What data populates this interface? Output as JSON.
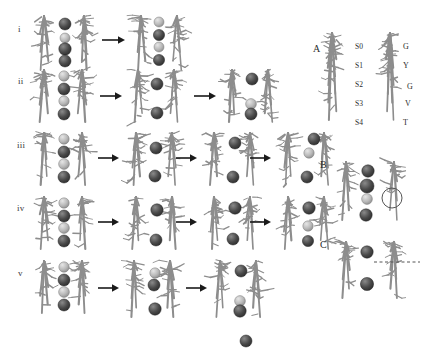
{
  "figure": {
    "title_visible": false,
    "background": "#ffffff",
    "ion_color_dark": "#4a4a4a",
    "ion_color_light": "#b9b9b9",
    "backbone_color": "#8d8d8d",
    "arrow_color": "#1a1a1a",
    "annotation_color": "#555555"
  },
  "left_panel": {
    "rows": [
      {
        "label": "i",
        "label_x": 18,
        "label_y": 24,
        "y": 14,
        "states": [
          {
            "x": 34,
            "width": 62,
            "height": 58,
            "ions": [
              {
                "cx": 31,
                "cy": 10,
                "r": 6.0,
                "shade": "dark"
              },
              {
                "cx": 31,
                "cy": 24,
                "r": 5.0,
                "shade": "light"
              },
              {
                "cx": 31,
                "cy": 35,
                "r": 6.2,
                "shade": "dark"
              },
              {
                "cx": 31,
                "cy": 47,
                "r": 6.0,
                "shade": "dark"
              }
            ]
          },
          {
            "x": 131,
            "width": 58,
            "height": 58,
            "ions": [
              {
                "cx": 28,
                "cy": 8,
                "r": 5.0,
                "shade": "light"
              },
              {
                "cx": 28,
                "cy": 21,
                "r": 5.6,
                "shade": "dark"
              },
              {
                "cx": 28,
                "cy": 33,
                "r": 5.0,
                "shade": "light"
              },
              {
                "cx": 28,
                "cy": 46,
                "r": 5.6,
                "shade": "dark"
              }
            ]
          }
        ],
        "arrows": [
          {
            "x": 102,
            "y": 40,
            "len": 22
          }
        ],
        "free_ions": []
      },
      {
        "label": "ii",
        "label_x": 18,
        "label_y": 76,
        "y": 68,
        "states": [
          {
            "x": 34,
            "width": 60,
            "height": 56,
            "ions": [
              {
                "cx": 30,
                "cy": 8,
                "r": 5.2,
                "shade": "light"
              },
              {
                "cx": 30,
                "cy": 21,
                "r": 6.0,
                "shade": "dark"
              },
              {
                "cx": 30,
                "cy": 33,
                "r": 5.2,
                "shade": "light"
              },
              {
                "cx": 30,
                "cy": 46,
                "r": 6.0,
                "shade": "dark"
              }
            ]
          },
          {
            "x": 128,
            "width": 58,
            "height": 56,
            "ions": [
              {
                "cx": 29,
                "cy": 16,
                "r": 6.0,
                "shade": "dark"
              },
              {
                "cx": 29,
                "cy": 45,
                "r": 6.0,
                "shade": "dark"
              }
            ]
          },
          {
            "x": 222,
            "width": 58,
            "height": 56,
            "ions": [
              {
                "cx": 30,
                "cy": 11,
                "r": 6.0,
                "shade": "dark"
              },
              {
                "cx": 29,
                "cy": 36,
                "r": 5.4,
                "shade": "light"
              },
              {
                "cx": 29,
                "cy": 46,
                "r": 6.0,
                "shade": "dark"
              }
            ]
          }
        ],
        "arrows": [
          {
            "x": 100,
            "y": 96,
            "len": 21
          },
          {
            "x": 194,
            "y": 96,
            "len": 21
          }
        ],
        "free_ions": []
      },
      {
        "label": "iii",
        "label_x": 17,
        "label_y": 140,
        "y": 131,
        "states": [
          {
            "x": 34,
            "width": 60,
            "height": 56,
            "ions": [
              {
                "cx": 30,
                "cy": 8,
                "r": 5.2,
                "shade": "light"
              },
              {
                "cx": 30,
                "cy": 21,
                "r": 6.0,
                "shade": "dark"
              },
              {
                "cx": 30,
                "cy": 33,
                "r": 5.4,
                "shade": "light"
              },
              {
                "cx": 30,
                "cy": 46,
                "r": 6.0,
                "shade": "dark"
              }
            ]
          },
          {
            "x": 126,
            "width": 58,
            "height": 56,
            "ions": [
              {
                "cx": 30,
                "cy": 17,
                "r": 6.0,
                "shade": "dark"
              },
              {
                "cx": 29,
                "cy": 45,
                "r": 6.0,
                "shade": "dark"
              }
            ]
          },
          {
            "x": 204,
            "width": 58,
            "height": 56,
            "ions": [
              {
                "cx": 31,
                "cy": 12,
                "r": 6.0,
                "shade": "dark"
              },
              {
                "cx": 29,
                "cy": 46,
                "r": 6.0,
                "shade": "dark"
              }
            ]
          },
          {
            "x": 278,
            "width": 58,
            "height": 56,
            "ions": [
              {
                "cx": 31,
                "cy": 22,
                "r": 5.2,
                "shade": "light"
              },
              {
                "cx": 29,
                "cy": 46,
                "r": 6.0,
                "shade": "dark"
              }
            ]
          }
        ],
        "arrows": [
          {
            "x": 98,
            "y": 158,
            "len": 20
          },
          {
            "x": 176,
            "y": 158,
            "len": 20
          },
          {
            "x": 250,
            "y": 158,
            "len": 20
          }
        ],
        "free_ions": [
          {
            "x": 306,
            "y": 131,
            "r": 6.0,
            "shade": "dark"
          }
        ]
      },
      {
        "label": "iv",
        "label_x": 17,
        "label_y": 203,
        "y": 195,
        "states": [
          {
            "x": 34,
            "width": 60,
            "height": 56,
            "ions": [
              {
                "cx": 30,
                "cy": 8,
                "r": 5.2,
                "shade": "light"
              },
              {
                "cx": 30,
                "cy": 21,
                "r": 6.0,
                "shade": "dark"
              },
              {
                "cx": 30,
                "cy": 33,
                "r": 5.4,
                "shade": "light"
              },
              {
                "cx": 30,
                "cy": 46,
                "r": 6.0,
                "shade": "dark"
              }
            ]
          },
          {
            "x": 126,
            "width": 58,
            "height": 56,
            "ions": [
              {
                "cx": 31,
                "cy": 15,
                "r": 6.2,
                "shade": "dark"
              },
              {
                "cx": 30,
                "cy": 45,
                "r": 6.0,
                "shade": "dark"
              }
            ]
          },
          {
            "x": 204,
            "width": 58,
            "height": 56,
            "ions": [
              {
                "cx": 31,
                "cy": 13,
                "r": 6.2,
                "shade": "dark"
              },
              {
                "cx": 29,
                "cy": 44,
                "r": 6.0,
                "shade": "dark"
              }
            ]
          },
          {
            "x": 278,
            "width": 58,
            "height": 56,
            "ions": [
              {
                "cx": 31,
                "cy": 13,
                "r": 6.2,
                "shade": "dark"
              },
              {
                "cx": 30,
                "cy": 31,
                "r": 5.2,
                "shade": "light"
              },
              {
                "cx": 30,
                "cy": 46,
                "r": 5.6,
                "shade": "dark"
              }
            ]
          }
        ],
        "arrows": [
          {
            "x": 98,
            "y": 222,
            "len": 20
          },
          {
            "x": 176,
            "y": 222,
            "len": 20
          },
          {
            "x": 250,
            "y": 222,
            "len": 20
          }
        ],
        "free_ions": []
      },
      {
        "label": "v",
        "label_x": 18,
        "label_y": 268,
        "y": 259,
        "states": [
          {
            "x": 34,
            "width": 60,
            "height": 56,
            "ions": [
              {
                "cx": 30,
                "cy": 8,
                "r": 5.2,
                "shade": "light"
              },
              {
                "cx": 30,
                "cy": 21,
                "r": 6.0,
                "shade": "dark"
              },
              {
                "cx": 30,
                "cy": 33,
                "r": 5.4,
                "shade": "light"
              },
              {
                "cx": 30,
                "cy": 46,
                "r": 6.0,
                "shade": "dark"
              }
            ]
          },
          {
            "x": 124,
            "width": 58,
            "height": 60,
            "ions": [
              {
                "cx": 31,
                "cy": 14,
                "r": 5.2,
                "shade": "light"
              },
              {
                "cx": 30,
                "cy": 26,
                "r": 6.0,
                "shade": "dark"
              },
              {
                "cx": 31,
                "cy": 50,
                "r": 6.2,
                "shade": "dark"
              }
            ]
          },
          {
            "x": 210,
            "width": 58,
            "height": 60,
            "ions": [
              {
                "cx": 31,
                "cy": 12,
                "r": 6.0,
                "shade": "dark"
              },
              {
                "cx": 30,
                "cy": 42,
                "r": 5.4,
                "shade": "light"
              },
              {
                "cx": 30,
                "cy": 52,
                "r": 6.2,
                "shade": "dark"
              }
            ]
          }
        ],
        "arrows": [
          {
            "x": 98,
            "y": 288,
            "len": 20
          },
          {
            "x": 186,
            "y": 288,
            "len": 20
          }
        ],
        "free_ions": [
          {
            "x": 238,
            "y": 333,
            "r": 6.0,
            "shade": "dark"
          }
        ]
      }
    ]
  },
  "right_panel": {
    "panels": [
      {
        "label": "A",
        "label_x": 313,
        "label_y": 43,
        "structure_x": 318,
        "structure_y": 30,
        "structure_w": 100,
        "structure_h": 95,
        "site_labels": [
          {
            "text": "S0",
            "x": 355,
            "y": 42
          },
          {
            "text": "S1",
            "x": 355,
            "y": 61
          },
          {
            "text": "S2",
            "x": 355,
            "y": 80
          },
          {
            "text": "S3",
            "x": 355,
            "y": 99
          },
          {
            "text": "S4",
            "x": 355,
            "y": 118
          }
        ],
        "residue_labels": [
          {
            "text": "G",
            "x": 403,
            "y": 42
          },
          {
            "text": "Y",
            "x": 403,
            "y": 61
          },
          {
            "text": "G",
            "x": 407,
            "y": 82
          },
          {
            "text": "V",
            "x": 405,
            "y": 99
          },
          {
            "text": "T",
            "x": 403,
            "y": 118
          }
        ],
        "ions": []
      },
      {
        "label": "B",
        "label_x": 320,
        "label_y": 159,
        "structure_x": 336,
        "structure_y": 160,
        "structure_w": 70,
        "structure_h": 62,
        "site_labels": [],
        "residue_labels": [],
        "ions": [
          {
            "cx": 32,
            "cy": 11,
            "r": 6.2,
            "shade": "dark"
          },
          {
            "cx": 31,
            "cy": 26,
            "r": 7.0,
            "shade": "dark"
          },
          {
            "cx": 31,
            "cy": 39,
            "r": 5.4,
            "shade": "light"
          },
          {
            "cx": 30,
            "cy": 55,
            "r": 6.2,
            "shade": "dark"
          }
        ],
        "circle_annotation": {
          "cx": 56,
          "cy": 38,
          "r": 10
        }
      },
      {
        "label": "C",
        "label_x": 320,
        "label_y": 239,
        "structure_x": 336,
        "structure_y": 240,
        "structure_w": 70,
        "structure_h": 60,
        "site_labels": [],
        "residue_labels": [],
        "ions": [
          {
            "cx": 31,
            "cy": 12,
            "r": 6.2,
            "shade": "dark"
          },
          {
            "cx": 31,
            "cy": 44,
            "r": 6.6,
            "shade": "dark"
          }
        ],
        "dashed_annotation": {
          "x1": 374,
          "y1": 262,
          "x2": 420,
          "y2": 262
        }
      }
    ]
  }
}
